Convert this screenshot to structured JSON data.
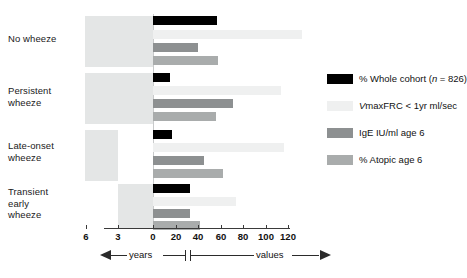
{
  "chart_data": {
    "type": "bar",
    "title": "",
    "xlabel": "",
    "ylabel": "",
    "orientation": "horizontal",
    "grid": false,
    "legend_position": "right",
    "axis_left_caption": "years",
    "axis_right_caption": "values",
    "left_axis_ticks": [
      "6",
      "3",
      "0"
    ],
    "left_axis_values": [
      6,
      3,
      0
    ],
    "right_axis_ticks": [
      "0",
      "20",
      "40",
      "60",
      "80",
      "100",
      "120"
    ],
    "right_axis_values": [
      0,
      20,
      40,
      60,
      80,
      100,
      120
    ],
    "xlim_years": [
      6,
      0
    ],
    "xlim_values": [
      0,
      120
    ],
    "categories": [
      "No wheeze",
      "Persistent wheeze",
      "Late-onset wheeze",
      "Transient early wheeze"
    ],
    "years_span": [
      {
        "category": "No wheeze",
        "from_years": 6,
        "to_years": 0
      },
      {
        "category": "Persistent wheeze",
        "from_years": 6,
        "to_years": 0
      },
      {
        "category": "Late-onset wheeze",
        "from_years": 6,
        "to_years": 3
      },
      {
        "category": "Transient early wheeze",
        "from_years": 3,
        "to_years": 0
      }
    ],
    "series": [
      {
        "name": "% Whole cohort (n = 826)",
        "key": "whole",
        "color": "#000000",
        "values": [
          57,
          15,
          17,
          33
        ]
      },
      {
        "name": "VmaxFRC < 1yr ml/sec",
        "key": "vmax",
        "color": "#eff0f0",
        "values": [
          132,
          114,
          116,
          74
        ]
      },
      {
        "name": "IgE IU/ml age 6",
        "key": "ige",
        "color": "#8d9091",
        "values": [
          40,
          71,
          45,
          33
        ]
      },
      {
        "name": "% Atopic age 6",
        "key": "atopic",
        "color": "#a9acac",
        "values": [
          58,
          56,
          62,
          42
        ]
      }
    ]
  },
  "labels": {
    "categories": [
      {
        "lines": [
          "No wheeze"
        ]
      },
      {
        "lines": [
          "Persistent",
          "wheeze"
        ]
      },
      {
        "lines": [
          "Late-onset",
          "wheeze"
        ]
      },
      {
        "lines": [
          "Transient",
          "early",
          "wheeze"
        ]
      }
    ]
  },
  "legend": {
    "items": [
      {
        "label_pre": "% Whole cohort (",
        "label_em": "n",
        "label_post": " = 826)",
        "key": "whole"
      },
      {
        "label_pre": "",
        "label_em": "V",
        "label_post": "maxFRC < 1yr ml/sec",
        "key": "vmax"
      },
      {
        "label_pre": "IgE IU/ml age 6",
        "label_em": "",
        "label_post": "",
        "key": "ige"
      },
      {
        "label_pre": "% Atopic age 6",
        "label_em": "",
        "label_post": "",
        "key": "atopic"
      }
    ]
  },
  "axis": {
    "left_caption": "years",
    "right_caption": "values",
    "ticks": [
      {
        "text": "6",
        "x": 86
      },
      {
        "text": "3",
        "x": 118
      },
      {
        "text": "0",
        "x": 153
      },
      {
        "text": "20",
        "x": 176
      },
      {
        "text": "40",
        "x": 198
      },
      {
        "text": "60",
        "x": 221
      },
      {
        "text": "80",
        "x": 243
      },
      {
        "text": "100",
        "x": 266
      },
      {
        "text": "120",
        "x": 288
      }
    ]
  },
  "colors": {
    "whole_cohort": "#000000",
    "vmaxfrc": "#eff0f0",
    "ige": "#8d9091",
    "atopic": "#a9acac",
    "yearbox": "#e4e6e6",
    "axis": "#2b2b2b"
  }
}
